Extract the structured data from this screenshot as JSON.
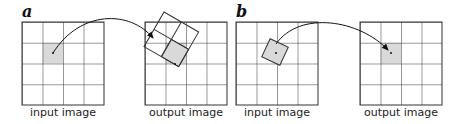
{
  "panels": [
    {
      "label": "a",
      "input_caption": "input image",
      "output_caption": "output image"
    },
    {
      "label": "b",
      "input_caption": "input image",
      "output_caption": "output image"
    }
  ],
  "colors": {
    "grid": "#333333",
    "highlight": "#d9d9d9",
    "arrow": "#111111"
  }
}
